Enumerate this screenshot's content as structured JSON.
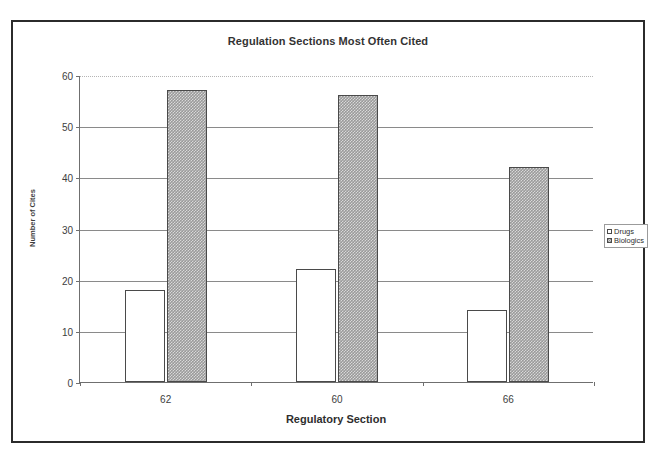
{
  "chart_data": {
    "type": "bar",
    "title": "Regulation Sections Most Often Cited",
    "xlabel": "Regulatory Section",
    "ylabel": "Number of Cites",
    "categories": [
      "62",
      "60",
      "66"
    ],
    "series": [
      {
        "name": "Drugs",
        "values": [
          18,
          22,
          14
        ]
      },
      {
        "name": "Biologics",
        "values": [
          57,
          56,
          42
        ]
      }
    ],
    "ylim": [
      0,
      60
    ],
    "yticks": [
      0,
      10,
      20,
      30,
      40,
      50,
      60
    ],
    "grid": true,
    "legend_position": "right"
  },
  "legend": {
    "items": [
      {
        "label": "Drugs",
        "swatch": "white-square-icon"
      },
      {
        "label": "Biologics",
        "swatch": "hatched-square-icon"
      }
    ]
  }
}
